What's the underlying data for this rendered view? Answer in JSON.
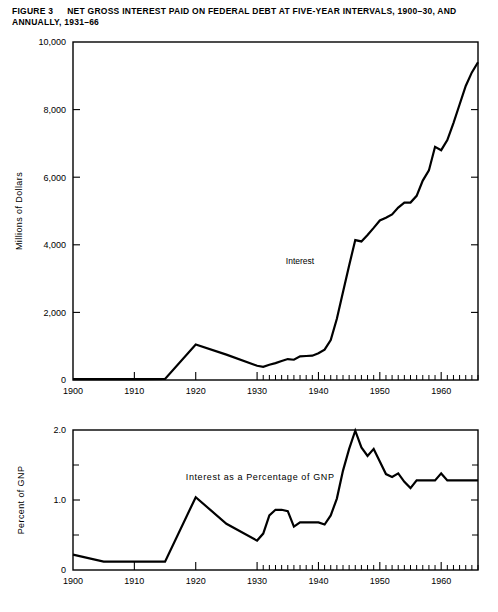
{
  "figure": {
    "number_label": "FIGURE 3",
    "title": "NET GROSS INTEREST PAID ON FEDERAL DEBT AT FIVE-YEAR INTERVALS, 1900–30, AND ANNUALLY, 1931–66"
  },
  "chart_data": [
    {
      "id": "interest-dollars",
      "type": "line",
      "title": "",
      "xlabel": "",
      "ylabel": "Millions of Dollars",
      "xlim": [
        1900,
        1966
      ],
      "ylim": [
        0,
        10000
      ],
      "grid": false,
      "legend": "none",
      "yticks": [
        0,
        2000,
        4000,
        6000,
        8000,
        10000
      ],
      "ytick_labels": [
        "0",
        "2,000",
        "4,000",
        "6,000",
        "8,000",
        "10,000"
      ],
      "xticks": [
        1900,
        1910,
        1920,
        1930,
        1940,
        1950,
        1960
      ],
      "xtick_labels": [
        "1900",
        "1910",
        "1920",
        "1930",
        "1940",
        "1950",
        "1960"
      ],
      "x_minor_from": 1931,
      "x_minor_to": 1966,
      "annotations": [
        {
          "text": "Interest",
          "x": 1937.0,
          "y": 3420
        }
      ],
      "series": [
        {
          "name": "Interest",
          "x": [
            1900,
            1905,
            1910,
            1915,
            1920,
            1925,
            1930,
            1931,
            1932,
            1933,
            1934,
            1935,
            1936,
            1937,
            1938,
            1939,
            1940,
            1941,
            1942,
            1943,
            1944,
            1945,
            1946,
            1947,
            1948,
            1949,
            1950,
            1951,
            1952,
            1953,
            1954,
            1955,
            1956,
            1957,
            1958,
            1959,
            1960,
            1961,
            1962,
            1963,
            1964,
            1965,
            1966
          ],
          "values": [
            25,
            25,
            25,
            30,
            1050,
            750,
            420,
            390,
            450,
            500,
            560,
            620,
            600,
            700,
            710,
            720,
            790,
            900,
            1180,
            1810,
            2600,
            3390,
            4140,
            4100,
            4290,
            4500,
            4720,
            4800,
            4900,
            5100,
            5250,
            5250,
            5450,
            5900,
            6200,
            6900,
            6800,
            7100,
            7600,
            8150,
            8700,
            9100,
            9400
          ]
        }
      ]
    },
    {
      "id": "interest-pct-gnp",
      "type": "line",
      "title": "",
      "xlabel": "",
      "ylabel": "Percent of GNP",
      "xlim": [
        1900,
        1966
      ],
      "ylim": [
        0,
        2.0
      ],
      "grid": false,
      "legend": "none",
      "yticks": [
        0,
        1.0,
        2.0
      ],
      "ytick_labels": [
        "0",
        "1.0",
        "2.0"
      ],
      "y_minor_ticks": [
        0.5,
        1.5
      ],
      "xticks": [
        1900,
        1910,
        1920,
        1930,
        1940,
        1950,
        1960
      ],
      "xtick_labels": [
        "1900",
        "1910",
        "1920",
        "1930",
        "1940",
        "1950",
        "1960"
      ],
      "x_minor_from": 1931,
      "x_minor_to": 1966,
      "annotations": [
        {
          "text": "Interest as a Percentage of GNP",
          "x": 1930.5,
          "y": 1.28
        }
      ],
      "series": [
        {
          "name": "Interest as a Percentage of GNP",
          "x": [
            1900,
            1905,
            1910,
            1915,
            1920,
            1925,
            1930,
            1931,
            1932,
            1933,
            1934,
            1935,
            1936,
            1937,
            1938,
            1939,
            1940,
            1941,
            1942,
            1943,
            1944,
            1945,
            1946,
            1947,
            1948,
            1949,
            1950,
            1951,
            1952,
            1953,
            1954,
            1955,
            1956,
            1957,
            1958,
            1959,
            1960,
            1961,
            1962,
            1963,
            1964,
            1965,
            1966
          ],
          "values": [
            0.22,
            0.12,
            0.12,
            0.12,
            1.04,
            0.66,
            0.42,
            0.52,
            0.78,
            0.86,
            0.86,
            0.84,
            0.62,
            0.68,
            0.68,
            0.68,
            0.68,
            0.65,
            0.78,
            1.02,
            1.42,
            1.73,
            1.99,
            1.75,
            1.63,
            1.73,
            1.55,
            1.37,
            1.33,
            1.38,
            1.26,
            1.17,
            1.28,
            1.28,
            1.28,
            1.28,
            1.38,
            1.28,
            1.28,
            1.28,
            1.28,
            1.28,
            1.28
          ]
        }
      ]
    }
  ]
}
